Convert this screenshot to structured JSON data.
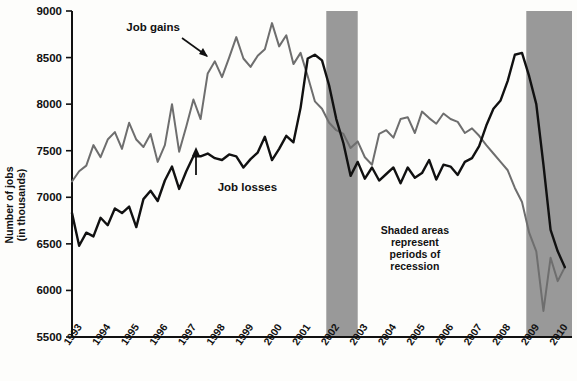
{
  "chart_data": {
    "type": "line",
    "title": "",
    "xlabel": "",
    "ylabel": "Number of jobs (in thousands)",
    "ylim": [
      5500,
      9000
    ],
    "ytick_values": [
      5500,
      6000,
      6500,
      7000,
      7500,
      8000,
      8500,
      9000
    ],
    "ytick_labels": [
      "5500",
      "6000",
      "6500",
      "7000",
      "7500",
      "8000",
      "8500",
      "9000"
    ],
    "xlim": [
      1993,
      2010.5
    ],
    "xtick_values": [
      1993,
      1994,
      1995,
      1996,
      1997,
      1998,
      1999,
      2000,
      2001,
      2002,
      2003,
      2004,
      2005,
      2006,
      2007,
      2008,
      2009,
      2010
    ],
    "xtick_labels": [
      "1993",
      "1994",
      "1995",
      "1996",
      "1997",
      "1998",
      "1999",
      "2000",
      "2001",
      "2002",
      "2003",
      "2004",
      "2005",
      "2006",
      "2007",
      "2008",
      "2009",
      "2010"
    ],
    "grid": false,
    "legend_position": "inline-annotations",
    "series": [
      {
        "name": "Job gains",
        "color": "#6e6e6e",
        "x": [
          1993.0,
          1993.25,
          1993.5,
          1993.75,
          1994.0,
          1994.25,
          1994.5,
          1994.75,
          1995.0,
          1995.25,
          1995.5,
          1995.75,
          1996.0,
          1996.25,
          1996.5,
          1996.75,
          1997.0,
          1997.25,
          1997.5,
          1997.75,
          1998.0,
          1998.25,
          1998.5,
          1998.75,
          1999.0,
          1999.25,
          1999.5,
          1999.75,
          2000.0,
          2000.25,
          2000.5,
          2000.75,
          2001.0,
          2001.25,
          2001.5,
          2001.75,
          2002.0,
          2002.25,
          2002.5,
          2002.75,
          2003.0,
          2003.25,
          2003.5,
          2003.75,
          2004.0,
          2004.25,
          2004.5,
          2004.75,
          2005.0,
          2005.25,
          2005.5,
          2005.75,
          2006.0,
          2006.25,
          2006.5,
          2006.75,
          2007.0,
          2007.25,
          2007.5,
          2007.75,
          2008.0,
          2008.25,
          2008.5,
          2008.75,
          2009.0,
          2009.25,
          2009.5,
          2009.75,
          2010.0,
          2010.25
        ],
        "values": [
          7170,
          7280,
          7340,
          7560,
          7430,
          7620,
          7700,
          7520,
          7800,
          7620,
          7540,
          7680,
          7380,
          7560,
          8000,
          7490,
          7760,
          8050,
          7840,
          8330,
          8460,
          8290,
          8500,
          8720,
          8490,
          8400,
          8520,
          8590,
          8870,
          8620,
          8740,
          8430,
          8550,
          8300,
          8030,
          7950,
          7800,
          7720,
          7680,
          7530,
          7600,
          7430,
          7350,
          7680,
          7720,
          7640,
          7840,
          7860,
          7690,
          7920,
          7850,
          7790,
          7900,
          7840,
          7810,
          7690,
          7740,
          7660,
          7560,
          7470,
          7380,
          7290,
          7100,
          6950,
          6620,
          6420,
          5780,
          6350,
          6100,
          6250
        ]
      },
      {
        "name": "Job losses",
        "color": "#111111",
        "x": [
          1993.0,
          1993.25,
          1993.5,
          1993.75,
          1994.0,
          1994.25,
          1994.5,
          1994.75,
          1995.0,
          1995.25,
          1995.5,
          1995.75,
          1996.0,
          1996.25,
          1996.5,
          1996.75,
          1997.0,
          1997.25,
          1997.5,
          1997.75,
          1998.0,
          1998.25,
          1998.5,
          1998.75,
          1999.0,
          1999.25,
          1999.5,
          1999.75,
          2000.0,
          2000.25,
          2000.5,
          2000.75,
          2001.0,
          2001.25,
          2001.5,
          2001.75,
          2002.0,
          2002.25,
          2002.5,
          2002.75,
          2003.0,
          2003.25,
          2003.5,
          2003.75,
          2004.0,
          2004.25,
          2004.5,
          2004.75,
          2005.0,
          2005.25,
          2005.5,
          2005.75,
          2006.0,
          2006.25,
          2006.5,
          2006.75,
          2007.0,
          2007.25,
          2007.5,
          2007.75,
          2008.0,
          2008.25,
          2008.5,
          2008.75,
          2009.0,
          2009.25,
          2009.5,
          2009.75,
          2010.0,
          2010.25
        ],
        "values": [
          6830,
          6480,
          6620,
          6580,
          6780,
          6700,
          6880,
          6830,
          6900,
          6680,
          6980,
          7070,
          6960,
          7180,
          7330,
          7090,
          7280,
          7440,
          7440,
          7470,
          7420,
          7400,
          7460,
          7440,
          7320,
          7410,
          7480,
          7650,
          7400,
          7520,
          7660,
          7590,
          7960,
          8490,
          8530,
          8470,
          8200,
          7840,
          7580,
          7230,
          7380,
          7200,
          7320,
          7180,
          7250,
          7320,
          7150,
          7320,
          7210,
          7260,
          7400,
          7190,
          7350,
          7330,
          7240,
          7380,
          7420,
          7550,
          7770,
          7950,
          8040,
          8250,
          8530,
          8550,
          8300,
          8000,
          7350,
          6650,
          6420,
          6250
        ]
      }
    ],
    "shaded_regions": [
      {
        "label": "recession",
        "x0": 2001.9,
        "x1": 2003.0,
        "color": "#999999"
      },
      {
        "label": "recession",
        "x0": 2008.9,
        "x1": 2010.5,
        "color": "#999999"
      }
    ],
    "annotations": [
      {
        "name": "job-gains-label",
        "text": "Job gains",
        "x": 1994.9,
        "y": 8790
      },
      {
        "name": "job-losses-label",
        "text": "Job losses",
        "x": 1998.1,
        "y": 7070
      },
      {
        "name": "recession-note",
        "lines": [
          "Shaded areas",
          "represent",
          "periods of",
          "recession"
        ],
        "x": 2005.0,
        "y": 6610
      }
    ]
  }
}
